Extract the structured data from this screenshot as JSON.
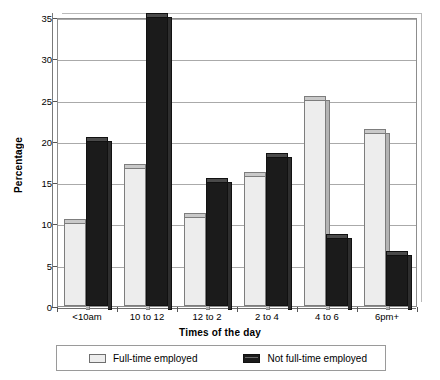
{
  "chart_data": {
    "type": "bar",
    "title": "",
    "xlabel": "Times of the day",
    "ylabel": "Percentage",
    "categories": [
      "<10am",
      "10 to 12",
      "12 to 2",
      "2 to 4",
      "4 to 6",
      "6pm+"
    ],
    "series": [
      {
        "name": "Full-time employed",
        "color": "#ededed",
        "values": [
          10,
          16.7,
          10.8,
          15.8,
          25,
          21
        ]
      },
      {
        "name": "Not full-time employed",
        "color": "#1b1b1b",
        "values": [
          20,
          35,
          15,
          18,
          8.2,
          6.2
        ]
      }
    ],
    "ylim": [
      0,
      35
    ],
    "yticks": [
      0,
      5,
      10,
      15,
      20,
      25,
      30,
      35
    ],
    "ytick_labels": [
      "0",
      "5",
      "10",
      "15",
      "20",
      "25",
      "30",
      "35"
    ],
    "grid": true,
    "legend_position": "bottom"
  },
  "legend": {
    "entries": [
      {
        "label": "Full-time employed"
      },
      {
        "label": "Not full-time employed"
      }
    ]
  }
}
